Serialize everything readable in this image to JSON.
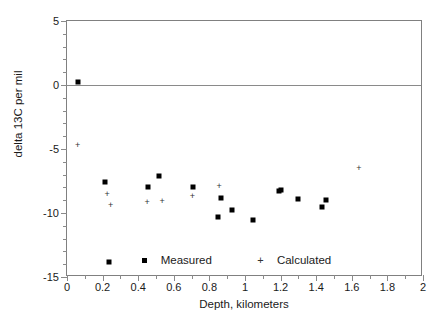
{
  "chart_data": {
    "type": "scatter",
    "title": "",
    "xlabel": "Depth,  kilometers",
    "ylabel": "delta 13C per mil",
    "xlim": [
      0,
      2
    ],
    "ylim": [
      -15,
      5
    ],
    "xticks": [
      0,
      0.2,
      0.4,
      0.6,
      0.8,
      1,
      1.2,
      1.4,
      1.6,
      1.8,
      2
    ],
    "xtick_labels": [
      "0",
      "0.2",
      "0.4",
      "0.6",
      "0.8",
      "1",
      "1.2",
      "1.4",
      "1.6",
      "1.8",
      "2"
    ],
    "x_minor_step": 0.1,
    "yticks": [
      5,
      0,
      -5,
      -10,
      -15
    ],
    "ytick_labels": [
      "5",
      "0",
      "-5",
      "-10",
      "-15"
    ],
    "y_minor_step": 1,
    "grid": false,
    "reference_lines": [
      {
        "axis": "y",
        "value": 0,
        "color": "#8a8a8a"
      }
    ],
    "legend_position": "inside-bottom-center",
    "series": [
      {
        "name": "Measured",
        "marker": "square",
        "color": "#000000",
        "points": [
          {
            "x": 0.06,
            "y": 0.2
          },
          {
            "x": 0.215,
            "y": -7.6
          },
          {
            "x": 0.235,
            "y": -13.8
          },
          {
            "x": 0.455,
            "y": -8.0
          },
          {
            "x": 0.515,
            "y": -7.1
          },
          {
            "x": 0.71,
            "y": -8.0
          },
          {
            "x": 0.85,
            "y": -10.35
          },
          {
            "x": 0.865,
            "y": -8.8
          },
          {
            "x": 0.925,
            "y": -9.8
          },
          {
            "x": 1.045,
            "y": -10.55
          },
          {
            "x": 1.19,
            "y": -8.25
          },
          {
            "x": 1.205,
            "y": -8.2
          },
          {
            "x": 1.3,
            "y": -8.9
          },
          {
            "x": 1.435,
            "y": -9.55
          },
          {
            "x": 1.455,
            "y": -9.0
          }
        ]
      },
      {
        "name": "Calculated",
        "marker": "plus",
        "color": "#333333",
        "points": [
          {
            "x": 0.06,
            "y": -4.65
          },
          {
            "x": 0.225,
            "y": -8.5
          },
          {
            "x": 0.245,
            "y": -9.4
          },
          {
            "x": 0.45,
            "y": -9.15
          },
          {
            "x": 0.535,
            "y": -9.1
          },
          {
            "x": 0.705,
            "y": -8.7
          },
          {
            "x": 0.855,
            "y": -7.9
          },
          {
            "x": 1.64,
            "y": -6.45
          }
        ]
      }
    ]
  },
  "legend": {
    "measured_label": "Measured",
    "calculated_label": "Calculated",
    "measured_marker": "square-marker-icon",
    "calculated_marker": "plus-marker-icon"
  },
  "colors": {
    "axis": "#808080",
    "zero_line": "#8a8a8a",
    "measured": "#000000",
    "calculated": "#333333",
    "background": "#ffffff"
  }
}
